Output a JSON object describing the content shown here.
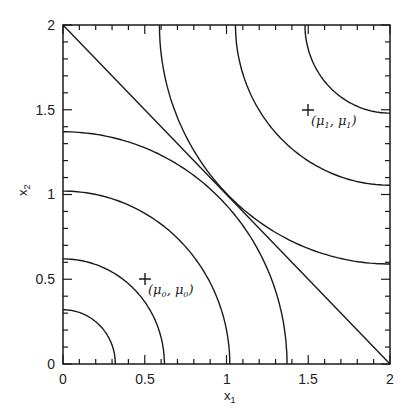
{
  "chart_data": {
    "type": "contour",
    "title": "",
    "xlabel": "x",
    "xlabel_sub": "1",
    "ylabel": "x",
    "ylabel_sub": "2",
    "xlim": [
      0,
      2
    ],
    "ylim": [
      0,
      2
    ],
    "x_ticks": [
      "0",
      "0.5",
      "1",
      "1.5",
      "2"
    ],
    "y_ticks": [
      "0",
      "0.5",
      "1",
      "1.5",
      "2"
    ],
    "minor_tick_step": 0.1,
    "grid": false,
    "decision_boundary": {
      "from": [
        0,
        2
      ],
      "to": [
        2,
        0
      ],
      "equation": "x1 + x2 = 2"
    },
    "contours_class0": {
      "center": [
        0,
        0
      ],
      "axis_intercepts": [
        0.32,
        0.62,
        1.02,
        1.37
      ]
    },
    "contours_class1": {
      "center": [
        2,
        2
      ],
      "top_edge_x_intercepts": [
        1.49,
        1.07,
        0.6
      ],
      "right_edge_y_intercepts": [
        1.47,
        1.04,
        0.58
      ]
    },
    "markers": [
      {
        "name": "mu0",
        "x": 0.5,
        "y": 0.5,
        "label_main": "(μ",
        "label_sub": "0",
        "label_mid": ", μ",
        "label_sub2": "0",
        "label_end": ")"
      },
      {
        "name": "mu1",
        "x": 1.5,
        "y": 1.5,
        "label_main": "(μ",
        "label_sub": "1",
        "label_mid": ", μ",
        "label_sub2": "1",
        "label_end": ")"
      }
    ]
  }
}
